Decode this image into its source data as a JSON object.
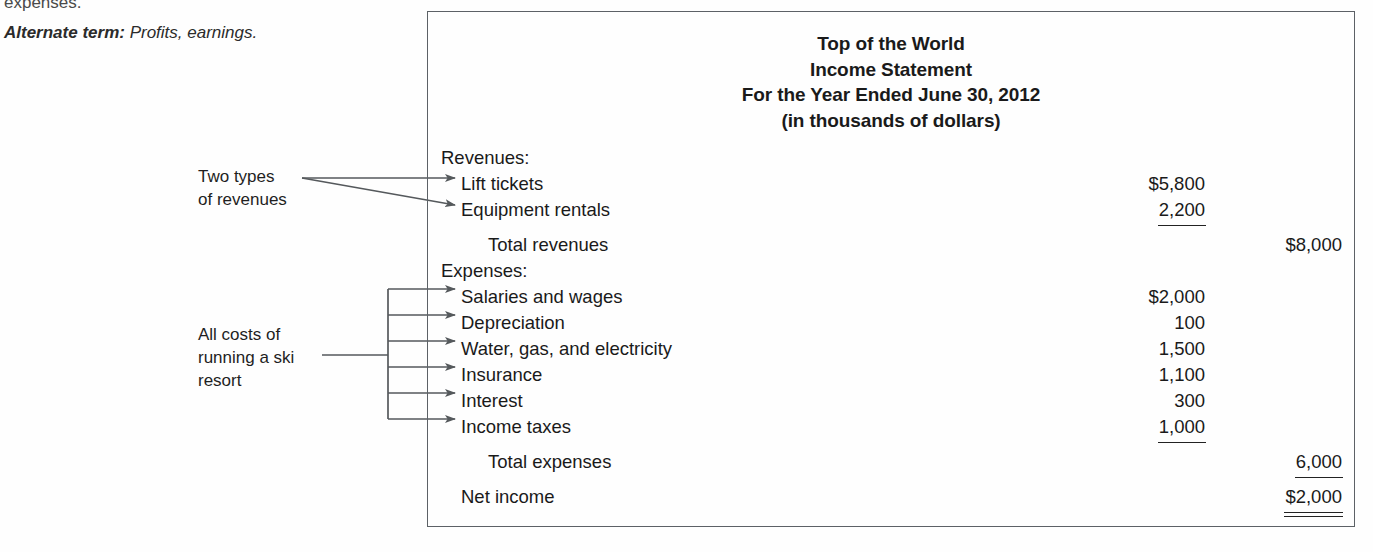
{
  "margin_notes": {
    "cut_text": "expenses.",
    "alternate_label": "Alternate term:",
    "alternate_value": "Profits, earnings."
  },
  "callouts": [
    {
      "name": "revenues",
      "line1": "Two types",
      "line2": "of revenues"
    },
    {
      "name": "expenses",
      "line1": "All costs of",
      "line2": "running a ski",
      "line3": "resort"
    }
  ],
  "statement": {
    "header": {
      "company": "Top of the World",
      "title": "Income Statement",
      "period": "For the Year Ended June 30, 2012",
      "units": "(in thousands of dollars)"
    },
    "sections": [
      {
        "heading": "Revenues:",
        "items": [
          {
            "label": "Lift tickets",
            "col1": "$5,800",
            "col2": "",
            "rule": "none"
          },
          {
            "label": "Equipment rentals",
            "col1": "2,200",
            "col2": "",
            "rule": "single"
          }
        ],
        "total": {
          "label": "Total revenues",
          "col1": "",
          "col2": "$8,000",
          "rule": "none"
        }
      },
      {
        "heading": "Expenses:",
        "items": [
          {
            "label": "Salaries and wages",
            "col1": "$2,000",
            "col2": "",
            "rule": "none"
          },
          {
            "label": "Depreciation",
            "col1": "100",
            "col2": "",
            "rule": "none"
          },
          {
            "label": "Water, gas, and electricity",
            "col1": "1,500",
            "col2": "",
            "rule": "none"
          },
          {
            "label": "Insurance",
            "col1": "1,100",
            "col2": "",
            "rule": "none"
          },
          {
            "label": "Interest",
            "col1": "300",
            "col2": "",
            "rule": "none"
          },
          {
            "label": "Income taxes",
            "col1": "1,000",
            "col2": "",
            "rule": "single"
          }
        ],
        "total": {
          "label": "Total expenses",
          "col1": "",
          "col2": "6,000",
          "rule": "single"
        }
      }
    ],
    "net_income": {
      "label": "Net income",
      "col1": "",
      "col2": "$2,000",
      "rule": "double"
    }
  },
  "colors": {
    "box_border": "#5c6166",
    "pointer": "#55595c",
    "text": "#1a1a1a"
  }
}
